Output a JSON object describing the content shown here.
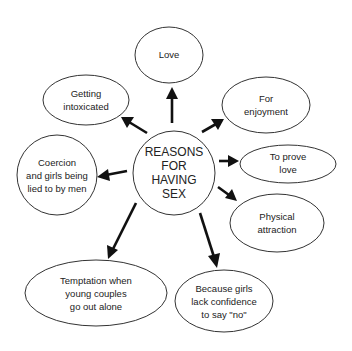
{
  "diagram": {
    "type": "mind-map",
    "center": {
      "lines": [
        "REASONS",
        "FOR",
        "HAVING",
        "SEX"
      ]
    },
    "nodes": [
      {
        "id": "love",
        "lines": [
          "Love"
        ]
      },
      {
        "id": "intoxicated",
        "lines": [
          "Getting",
          "intoxicated"
        ]
      },
      {
        "id": "enjoyment",
        "lines": [
          "For",
          "enjoyment"
        ]
      },
      {
        "id": "coercion",
        "lines": [
          "Coercion",
          "and girls being",
          "lied to by men"
        ]
      },
      {
        "id": "prove-love",
        "lines": [
          "To prove",
          "love"
        ]
      },
      {
        "id": "physical",
        "lines": [
          "Physical",
          "attraction"
        ]
      },
      {
        "id": "temptation",
        "lines": [
          "Temptation when",
          "young couples",
          "go out alone"
        ]
      },
      {
        "id": "confidence",
        "lines": [
          "Because girls",
          "lack confidence",
          "to say \"no\""
        ]
      }
    ],
    "edges": [
      {
        "from": "center",
        "to": "love"
      },
      {
        "from": "center",
        "to": "intoxicated"
      },
      {
        "from": "center",
        "to": "enjoyment"
      },
      {
        "from": "center",
        "to": "coercion"
      },
      {
        "from": "center",
        "to": "prove-love"
      },
      {
        "from": "center",
        "to": "physical"
      },
      {
        "from": "center",
        "to": "temptation"
      },
      {
        "from": "center",
        "to": "confidence"
      }
    ]
  }
}
